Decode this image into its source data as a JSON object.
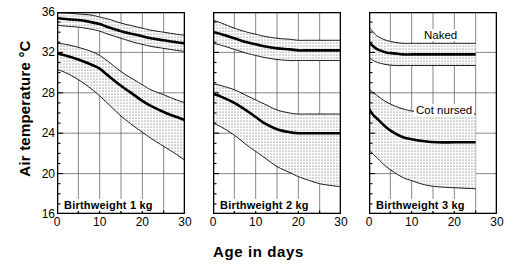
{
  "chart_data": {
    "type": "area",
    "title": "",
    "xlabel": "Age  in days",
    "ylabel": "Air temperature  °C",
    "xlim": [
      0,
      30
    ],
    "ylim": [
      16,
      36
    ],
    "xticks": [
      0,
      10,
      20,
      30
    ],
    "yticks": [
      16,
      20,
      24,
      28,
      32,
      36
    ],
    "yminor_step": 1,
    "xminor_step": 5,
    "grid": true,
    "legend_position": "in-plot annotations on third panel",
    "annotations": [
      "Naked",
      "Cot nursed"
    ],
    "panels": [
      {
        "caption": "Birthweight  1 kg",
        "series": [
          {
            "name": "Naked",
            "x": [
              0,
              2,
              5,
              8,
              10,
              12,
              15,
              18,
              20,
              22,
              25,
              28,
              30
            ],
            "center": [
              35.4,
              35.3,
              35.2,
              35.0,
              34.8,
              34.5,
              34.1,
              33.8,
              33.6,
              33.4,
              33.2,
              33.0,
              32.9
            ],
            "upper": [
              35.9,
              35.9,
              35.8,
              35.7,
              35.5,
              35.3,
              34.9,
              34.6,
              34.4,
              34.2,
              34.0,
              33.8,
              33.7
            ],
            "lower": [
              34.7,
              34.6,
              34.5,
              34.3,
              34.1,
              33.8,
              33.4,
              33.0,
              32.8,
              32.6,
              32.4,
              32.2,
              32.1
            ]
          },
          {
            "name": "Cot nursed",
            "x": [
              0,
              2,
              5,
              8,
              10,
              12,
              15,
              18,
              20,
              22,
              25,
              28,
              30
            ],
            "center": [
              31.9,
              31.7,
              31.3,
              30.8,
              30.4,
              29.7,
              28.7,
              27.8,
              27.2,
              26.7,
              26.1,
              25.6,
              25.3
            ],
            "upper": [
              32.9,
              32.8,
              32.5,
              32.1,
              31.7,
              31.1,
              30.1,
              29.3,
              28.8,
              28.3,
              27.8,
              27.3,
              27.0
            ],
            "lower": [
              30.3,
              30.0,
              29.3,
              28.4,
              27.7,
              26.9,
              25.7,
              24.7,
              24.1,
              23.5,
              22.7,
              21.9,
              21.3
            ]
          }
        ]
      },
      {
        "caption": "Birthweight  2 kg",
        "series": [
          {
            "name": "Naked",
            "x": [
              0,
              2,
              5,
              8,
              10,
              12,
              15,
              18,
              20,
              22,
              25,
              28,
              30
            ],
            "center": [
              34.0,
              33.8,
              33.4,
              33.0,
              32.8,
              32.6,
              32.4,
              32.3,
              32.2,
              32.2,
              32.2,
              32.2,
              32.2
            ],
            "upper": [
              35.2,
              34.9,
              34.4,
              34.0,
              33.8,
              33.6,
              33.4,
              33.3,
              33.2,
              33.2,
              33.2,
              33.2,
              33.2
            ],
            "lower": [
              32.9,
              32.7,
              32.3,
              31.9,
              31.7,
              31.5,
              31.3,
              31.2,
              31.2,
              31.2,
              31.2,
              31.2,
              31.2
            ]
          },
          {
            "name": "Cot nursed",
            "x": [
              0,
              2,
              5,
              8,
              10,
              12,
              15,
              18,
              20,
              22,
              25,
              28,
              30
            ],
            "center": [
              27.9,
              27.6,
              27.0,
              26.2,
              25.6,
              25.0,
              24.4,
              24.1,
              24.0,
              24.0,
              24.0,
              24.0,
              24.0
            ],
            "upper": [
              28.9,
              28.7,
              28.3,
              27.7,
              27.3,
              26.9,
              26.3,
              26.0,
              25.9,
              25.9,
              25.9,
              25.9,
              25.9
            ],
            "lower": [
              25.0,
              24.6,
              23.8,
              22.8,
              22.2,
              21.6,
              20.7,
              20.1,
              19.7,
              19.4,
              19.0,
              18.8,
              18.7
            ]
          }
        ]
      },
      {
        "caption": "Birthweight  3 kg",
        "series": [
          {
            "name": "Naked",
            "x": [
              0,
              1,
              2,
              4,
              6,
              8,
              10,
              13,
              16,
              20,
              25
            ],
            "center": [
              33.0,
              32.6,
              32.3,
              32.0,
              31.9,
              31.8,
              31.8,
              31.8,
              31.8,
              31.8,
              31.8
            ],
            "upper": [
              34.5,
              34.0,
              33.6,
              33.2,
              33.0,
              32.9,
              32.9,
              32.9,
              32.9,
              32.9,
              32.9
            ],
            "lower": [
              31.5,
              31.2,
              31.0,
              30.8,
              30.7,
              30.7,
              30.7,
              30.7,
              30.7,
              30.7,
              30.7
            ]
          },
          {
            "name": "Cot nursed",
            "x": [
              0,
              1,
              2,
              4,
              6,
              8,
              10,
              13,
              16,
              20,
              25
            ],
            "center": [
              26.4,
              25.8,
              25.4,
              24.6,
              24.0,
              23.6,
              23.4,
              23.2,
              23.1,
              23.1,
              23.1
            ],
            "upper": [
              28.4,
              28.0,
              27.7,
              27.1,
              26.7,
              26.4,
              26.2,
              26.0,
              25.9,
              25.9,
              25.9
            ],
            "lower": [
              22.4,
              21.9,
              21.5,
              20.7,
              20.1,
              19.6,
              19.3,
              18.9,
              18.7,
              18.6,
              18.5
            ]
          }
        ]
      }
    ]
  },
  "axes": {
    "ylabel_text": "Air temperature",
    "ylabel_unit": "°C",
    "xlabel_text": "Age  in days",
    "yticks": [
      "36",
      "32",
      "28",
      "24",
      "20",
      "16"
    ],
    "xticks": [
      "0",
      "10",
      "20",
      "30"
    ]
  },
  "panels": [
    {
      "caption": "Birthweight  1 kg",
      "annotations": []
    },
    {
      "caption": "Birthweight  2 kg",
      "annotations": []
    },
    {
      "caption": "Birthweight  3 kg",
      "annotations": [
        "Naked",
        "Cot nursed"
      ]
    }
  ],
  "colors": {
    "ink": "#000000",
    "grid": "#555555",
    "band_fill": "#e8e8e8",
    "background": "#ffffff"
  }
}
